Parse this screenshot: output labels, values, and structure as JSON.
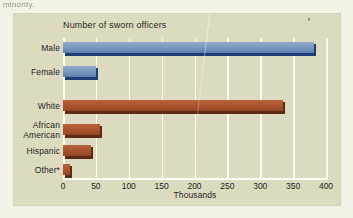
{
  "page": {
    "caption_fragment": "minority."
  },
  "figure": {
    "title": "Number of sworn officers",
    "background_color": "#dddcbf",
    "gridline_color": "#fbfbf2"
  },
  "chart_data": {
    "type": "bar",
    "orientation": "horizontal",
    "title": "Number of sworn officers",
    "xlabel": "Thousands",
    "ylabel": "",
    "xlim": [
      0,
      400
    ],
    "xticks": [
      0,
      50,
      100,
      150,
      200,
      250,
      300,
      350,
      400
    ],
    "xtick_labels": [
      "0",
      "50",
      "100",
      "150",
      "200",
      "250",
      "300",
      "350",
      "400"
    ],
    "grid": true,
    "legend": "none",
    "groups": [
      {
        "name": "Sex",
        "color": "#7d9bc2",
        "edge_color": "#1e3c78",
        "categories": [
          "Male",
          "Female"
        ],
        "values": [
          382,
          50
        ]
      },
      {
        "name": "Race/Ethnicity",
        "color": "#ad5530",
        "edge_color": "#5d2a15",
        "categories": [
          "White",
          "African American",
          "Hispanic",
          "Other*"
        ],
        "values": [
          334,
          56,
          43,
          10
        ]
      }
    ],
    "categories": [
      "Male",
      "Female",
      "White",
      "African American",
      "Hispanic",
      "Other*"
    ],
    "values": [
      382,
      50,
      334,
      56,
      43,
      10
    ],
    "bar_colors": [
      "#7d9bc2",
      "#7d9bc2",
      "#ad5530",
      "#ad5530",
      "#ad5530",
      "#ad5530"
    ],
    "footnote_marker": "*"
  },
  "bars": [
    {
      "label": "Male",
      "label2": "",
      "value": 382,
      "color": "blue",
      "top": 4,
      "height": 11
    },
    {
      "label": "Female",
      "label2": "",
      "value": 50,
      "color": "blue",
      "top": 28,
      "height": 11
    },
    {
      "label": "White",
      "label2": "",
      "value": 334,
      "color": "red",
      "top": 62,
      "height": 11
    },
    {
      "label": "African",
      "label2": "American",
      "value": 56,
      "color": "red",
      "top": 86,
      "height": 11
    },
    {
      "label": "Hispanic",
      "label2": "",
      "value": 43,
      "color": "red",
      "top": 107,
      "height": 11
    },
    {
      "label": "Other*",
      "label2": "",
      "value": 10,
      "color": "red",
      "top": 126,
      "height": 11
    }
  ]
}
